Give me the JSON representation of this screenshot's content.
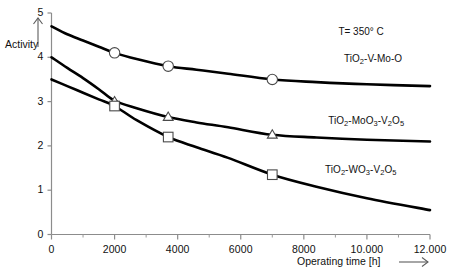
{
  "chart_data": {
    "type": "line",
    "title": "",
    "xlabel": "Operating time [h]",
    "ylabel": "Activity",
    "xlim": [
      0,
      12000
    ],
    "ylim": [
      0,
      5
    ],
    "grid": false,
    "legend_position": "inline-right",
    "annotations": [
      {
        "text": "T= 350° C",
        "x": 10300,
        "y": 4.55
      }
    ],
    "x_tick_labels": [
      "0",
      "2000",
      "4000",
      "6000",
      "8000",
      "10.000",
      "12.000"
    ],
    "x_ticks": [
      0,
      2000,
      4000,
      6000,
      8000,
      10000,
      12000
    ],
    "x_minor_ticks": [
      1000,
      3000,
      5000,
      7000,
      9000,
      11000
    ],
    "y_tick_labels": [
      "0",
      "1",
      "2",
      "3",
      "4",
      "5"
    ],
    "y_ticks": [
      0,
      1,
      2,
      3,
      4,
      5
    ],
    "series": [
      {
        "name": "TiO2-V-Mo-O",
        "label_html": "TiO<sub>2</sub>-V-Mo-O",
        "marker": "circle",
        "color": "#000000",
        "label_x": 10000,
        "label_y": 3.93,
        "x": [
          0,
          500,
          1000,
          1500,
          2000,
          2700,
          3700,
          4600,
          5600,
          7000,
          8400,
          10000,
          12000
        ],
        "y": [
          4.7,
          4.52,
          4.38,
          4.24,
          4.1,
          3.96,
          3.8,
          3.72,
          3.63,
          3.5,
          3.44,
          3.39,
          3.35
        ],
        "marker_points": [
          {
            "x": 2000,
            "y": 4.1
          },
          {
            "x": 3700,
            "y": 3.8
          },
          {
            "x": 7000,
            "y": 3.5
          }
        ]
      },
      {
        "name": "TiO2-MoO3-V2O5",
        "label_html": "TiO<sub>2</sub>-MoO<sub>3</sub>-V<sub>2</sub>O<sub>5</sub>",
        "marker": "triangle",
        "color": "#000000",
        "label_x": 9500,
        "label_y": 2.55,
        "x": [
          0,
          500,
          1000,
          1500,
          2000,
          2700,
          3700,
          4600,
          5600,
          7000,
          8400,
          10000,
          12000
        ],
        "y": [
          4.0,
          3.76,
          3.53,
          3.28,
          3.02,
          2.85,
          2.65,
          2.53,
          2.42,
          2.25,
          2.19,
          2.14,
          2.1
        ],
        "marker_points": [
          {
            "x": 2000,
            "y": 3.0
          },
          {
            "x": 3700,
            "y": 2.65
          },
          {
            "x": 7000,
            "y": 2.25
          }
        ]
      },
      {
        "name": "TiO2-WO3-V2O5",
        "label_html": "TiO<sub>2</sub>-WO<sub>3</sub>-V<sub>2</sub>O<sub>5</sub>",
        "marker": "square",
        "color": "#000000",
        "label_x": 9400,
        "label_y": 1.43,
        "x": [
          0,
          500,
          1000,
          1500,
          2000,
          2700,
          3700,
          4600,
          5600,
          7000,
          8400,
          10000,
          12000
        ],
        "y": [
          3.5,
          3.35,
          3.2,
          3.05,
          2.9,
          2.58,
          2.2,
          1.97,
          1.73,
          1.35,
          1.08,
          0.82,
          0.55
        ],
        "marker_points": [
          {
            "x": 2000,
            "y": 2.9
          },
          {
            "x": 3700,
            "y": 2.2
          },
          {
            "x": 7000,
            "y": 1.35
          }
        ]
      }
    ]
  },
  "axes": {
    "y_arrow": "up-arrow",
    "x_arrow": "right-arrow"
  }
}
